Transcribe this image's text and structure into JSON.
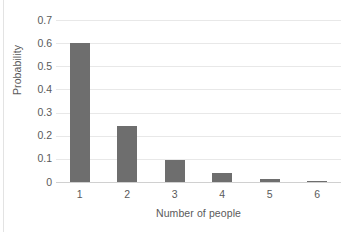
{
  "chart_data": {
    "type": "bar",
    "title": "",
    "subtitle": "",
    "xlabel": "Number of people",
    "ylabel": "Probability",
    "categories": [
      "1",
      "2",
      "3",
      "4",
      "5",
      "6"
    ],
    "values": [
      0.6,
      0.24,
      0.096,
      0.04,
      0.013,
      0.005
    ],
    "series": [
      {
        "name": "Probability",
        "values": [
          0.6,
          0.24,
          0.096,
          0.04,
          0.013,
          0.005
        ]
      }
    ],
    "ylim": [
      0,
      0.7
    ],
    "ytick_labels": [
      "0",
      "0.1",
      "0.2",
      "0.3",
      "0.4",
      "0.5",
      "0.6",
      "0.7"
    ],
    "ytick_values": [
      0,
      0.1,
      0.2,
      0.3,
      0.4,
      0.5,
      0.6,
      0.7
    ],
    "grid": "horizontal",
    "legend": "none",
    "bar_color": "#6e6e6e",
    "gridline_color": "#e8e8e8",
    "axis_color": "#d0d0d0",
    "text_color": "#5a5a5a",
    "background_color": "#ffffff"
  }
}
